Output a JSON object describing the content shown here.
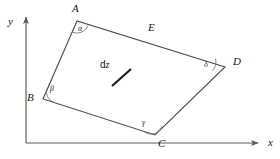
{
  "figure": {
    "title": "",
    "background_color": "#ffffff",
    "stroke_color": "#4a4a4a",
    "axis_color": "#5a5a5a",
    "text_color": "#141414",
    "width": 280,
    "height": 159
  },
  "axes": {
    "y_label": "y",
    "x_label": "x",
    "origin": {
      "x": 26,
      "y": 143
    },
    "y_axis_top": {
      "x": 26,
      "y": 15
    },
    "x_axis_right": {
      "x": 261,
      "y": 143
    },
    "y_label_pos": {
      "x": 8,
      "y": 16
    },
    "x_label_pos": {
      "x": 268,
      "y": 137
    }
  },
  "shape": {
    "type": "quadrilateral",
    "vertices": [
      {
        "name": "A",
        "x": 77,
        "y": 21,
        "label_pos": {
          "x": 72,
          "y": 4
        }
      },
      {
        "name": "B",
        "x": 43,
        "y": 99,
        "label_pos": {
          "x": 27,
          "y": 92
        }
      },
      {
        "name": "C",
        "x": 155,
        "y": 135,
        "label_pos": {
          "x": 158,
          "y": 139
        }
      },
      {
        "name": "D",
        "x": 225,
        "y": 67,
        "label_pos": {
          "x": 233,
          "y": 57
        }
      }
    ],
    "edges": [
      {
        "from": "A",
        "to": "B"
      },
      {
        "from": "B",
        "to": "C"
      },
      {
        "from": "C",
        "to": "D"
      },
      {
        "from": "D",
        "to": "A"
      }
    ],
    "edge_label": {
      "text": "E",
      "x": 148,
      "y": 23
    },
    "interior_label": {
      "text_d": "d",
      "text_z": "z",
      "x": 100,
      "y": 60,
      "tick": {
        "x1": 112,
        "y1": 86,
        "x2": 131,
        "y2": 69
      }
    }
  },
  "angles": [
    {
      "symbol": "α",
      "at_vertex": "A",
      "label_pos": {
        "x": 78,
        "y": 26
      }
    },
    {
      "symbol": "β",
      "at_vertex": "B",
      "label_pos": {
        "x": 50,
        "y": 86
      }
    },
    {
      "symbol": "γ",
      "at_vertex": "C",
      "label_pos": {
        "x": 142,
        "y": 120
      }
    },
    {
      "symbol": "δ",
      "at_vertex": "D",
      "label_pos": {
        "x": 204,
        "y": 62
      }
    }
  ]
}
